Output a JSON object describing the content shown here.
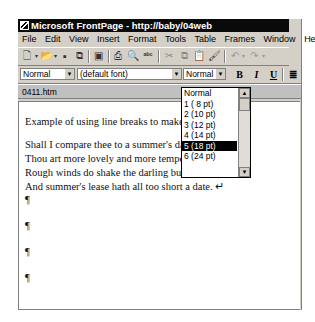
{
  "window": {
    "title": "Microsoft FrontPage - http://baby/04web"
  },
  "menubar": {
    "items": [
      {
        "label": "File"
      },
      {
        "label": "Edit"
      },
      {
        "label": "View"
      },
      {
        "label": "Insert"
      },
      {
        "label": "Format"
      },
      {
        "label": "Tools"
      },
      {
        "label": "Table"
      },
      {
        "label": "Frames"
      },
      {
        "label": "Window"
      },
      {
        "label": "Help"
      }
    ]
  },
  "toolbar": {
    "icons": {
      "new": "new-page-icon",
      "open": "open-folder-icon",
      "save": "save-icon",
      "publish": "publish-icon",
      "folder_list": "folder-list-icon",
      "print": "print-icon",
      "preview": "print-preview-icon",
      "spelling": "spelling-icon",
      "cut": "cut-icon",
      "copy": "copy-icon",
      "paste": "paste-icon",
      "format_painter": "format-painter-icon",
      "undo": "undo-icon",
      "redo": "redo-icon"
    }
  },
  "format_toolbar": {
    "style_value": "Normal",
    "font_value": "(default font)",
    "size_value": "Normal",
    "bold": "B",
    "italic": "I",
    "underline": "U",
    "align": "≣"
  },
  "size_dropdown": {
    "options": [
      "Normal",
      "1 ( 8 pt)",
      "2 (10 pt)",
      "3 (12 pt)",
      "4 (14 pt)",
      "5 (18 pt)",
      "6 (24 pt)"
    ],
    "selected": "5 (18 pt)"
  },
  "document_tab": {
    "label": "0411.htm"
  },
  "editor": {
    "lines": [
      "Example of using line breaks to make a block of text¶",
      "Shall I compare thee to a summer's day? ↵",
      "Thou art more lovely and more temperate; ↵",
      "Rough winds do shake the darling buds of May, ↵",
      "And summer's lease hath all too short a date. ↵",
      "¶",
      "¶",
      "¶",
      "¶"
    ]
  }
}
